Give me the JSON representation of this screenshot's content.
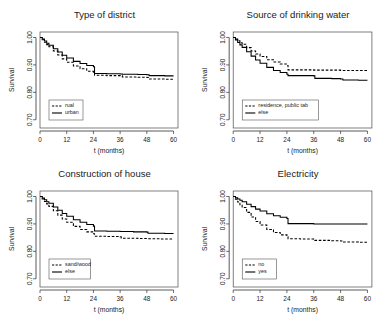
{
  "figure": {
    "background": "#ffffff",
    "line_color": "#000000",
    "axis_color": "#303030",
    "panel_layout": "2x2"
  },
  "chart_data": [
    {
      "type": "line",
      "title": "Type of district",
      "xlabel": "t (months)",
      "ylabel": "Survival",
      "xlim": [
        0,
        62
      ],
      "ylim": [
        0.67,
        1.02
      ],
      "xticks": [
        0,
        12,
        24,
        36,
        48,
        60
      ],
      "yticks": [
        0.7,
        0.8,
        0.9,
        1.0
      ],
      "ytick_labels": [
        "0.70",
        "0.80",
        "0.90",
        "1.00"
      ],
      "grid": false,
      "legend_position": "lower-left",
      "series": [
        {
          "name": "rual",
          "style": "dashed",
          "x": [
            0,
            1,
            2,
            3,
            4,
            6,
            8,
            10,
            12,
            15,
            18,
            21,
            24,
            24.5,
            30,
            36,
            37,
            44,
            48,
            49,
            56,
            60
          ],
          "y": [
            1.0,
            0.992,
            0.983,
            0.974,
            0.966,
            0.951,
            0.936,
            0.922,
            0.91,
            0.896,
            0.886,
            0.877,
            0.871,
            0.862,
            0.861,
            0.86,
            0.856,
            0.855,
            0.854,
            0.849,
            0.848,
            0.848
          ]
        },
        {
          "name": "urban",
          "style": "solid",
          "x": [
            0,
            1,
            2,
            3,
            4,
            6,
            8,
            10,
            12,
            15,
            18,
            21,
            24,
            24.5,
            30,
            36,
            37,
            44,
            48,
            49,
            56,
            60
          ],
          "y": [
            1.0,
            0.994,
            0.987,
            0.979,
            0.972,
            0.959,
            0.947,
            0.935,
            0.925,
            0.913,
            0.905,
            0.898,
            0.893,
            0.869,
            0.868,
            0.867,
            0.866,
            0.865,
            0.864,
            0.861,
            0.86,
            0.86
          ]
        }
      ]
    },
    {
      "type": "line",
      "title": "Source of drinking water",
      "xlabel": "t (months)",
      "ylabel": "Survival",
      "xlim": [
        0,
        62
      ],
      "ylim": [
        0.67,
        1.02
      ],
      "xticks": [
        0,
        12,
        24,
        36,
        48,
        60
      ],
      "yticks": [
        0.7,
        0.8,
        0.9,
        1.0
      ],
      "ytick_labels": [
        "0.70",
        "0.80",
        "0.90",
        "1.00"
      ],
      "grid": false,
      "legend_position": "lower-left",
      "series": [
        {
          "name": "residence, public tab",
          "style": "dashed",
          "x": [
            0,
            1,
            2,
            3,
            4,
            6,
            8,
            10,
            12,
            15,
            18,
            21,
            24,
            24.5,
            30,
            36,
            42,
            48,
            54,
            60
          ],
          "y": [
            1.0,
            0.994,
            0.988,
            0.981,
            0.975,
            0.963,
            0.951,
            0.94,
            0.931,
            0.919,
            0.911,
            0.903,
            0.898,
            0.882,
            0.882,
            0.881,
            0.881,
            0.88,
            0.88,
            0.879
          ]
        },
        {
          "name": "else",
          "style": "solid",
          "x": [
            0,
            1,
            2,
            3,
            4,
            6,
            8,
            10,
            12,
            15,
            18,
            21,
            24,
            24.5,
            30,
            36,
            36.5,
            44,
            48,
            49,
            56,
            60
          ],
          "y": [
            1.0,
            0.991,
            0.982,
            0.973,
            0.964,
            0.948,
            0.932,
            0.918,
            0.906,
            0.891,
            0.88,
            0.872,
            0.866,
            0.861,
            0.861,
            0.86,
            0.851,
            0.85,
            0.849,
            0.845,
            0.844,
            0.844
          ]
        }
      ]
    },
    {
      "type": "line",
      "title": "Construction of house",
      "xlabel": "t (months)",
      "ylabel": "Survival",
      "xlim": [
        0,
        62
      ],
      "ylim": [
        0.67,
        1.02
      ],
      "xticks": [
        0,
        12,
        24,
        36,
        48,
        60
      ],
      "yticks": [
        0.7,
        0.8,
        0.9,
        1.0
      ],
      "ytick_labels": [
        "0.70",
        "0.80",
        "0.90",
        "1.00"
      ],
      "grid": false,
      "legend_position": "lower-left",
      "series": [
        {
          "name": "sand/wood",
          "style": "dashed",
          "x": [
            0,
            1,
            2,
            3,
            4,
            6,
            8,
            10,
            12,
            15,
            18,
            21,
            24,
            24.5,
            30,
            36,
            36.5,
            44,
            48,
            54,
            60
          ],
          "y": [
            1.0,
            0.991,
            0.982,
            0.973,
            0.964,
            0.948,
            0.932,
            0.918,
            0.906,
            0.891,
            0.88,
            0.871,
            0.864,
            0.855,
            0.854,
            0.853,
            0.848,
            0.847,
            0.846,
            0.845,
            0.845
          ]
        },
        {
          "name": "else",
          "style": "solid",
          "x": [
            0,
            1,
            2,
            3,
            4,
            6,
            8,
            10,
            12,
            15,
            18,
            21,
            24,
            24.5,
            30,
            36,
            42,
            48,
            48.5,
            56,
            60
          ],
          "y": [
            1.0,
            0.994,
            0.988,
            0.981,
            0.975,
            0.962,
            0.95,
            0.938,
            0.928,
            0.915,
            0.906,
            0.898,
            0.892,
            0.874,
            0.873,
            0.872,
            0.871,
            0.87,
            0.866,
            0.865,
            0.865
          ]
        }
      ]
    },
    {
      "type": "line",
      "title": "Electricity",
      "xlabel": "t (months)",
      "ylabel": "Survival",
      "xlim": [
        0,
        62
      ],
      "ylim": [
        0.67,
        1.02
      ],
      "xticks": [
        0,
        12,
        24,
        36,
        48,
        60
      ],
      "yticks": [
        0.7,
        0.8,
        0.9,
        1.0
      ],
      "ytick_labels": [
        "0.70",
        "0.80",
        "0.90",
        "1.00"
      ],
      "grid": false,
      "legend_position": "lower-left",
      "series": [
        {
          "name": "no",
          "style": "dashed",
          "x": [
            0,
            1,
            2,
            3,
            4,
            6,
            8,
            10,
            12,
            15,
            18,
            21,
            24,
            24.5,
            30,
            36,
            36.5,
            44,
            48,
            49,
            56,
            60
          ],
          "y": [
            1.0,
            0.99,
            0.98,
            0.97,
            0.96,
            0.942,
            0.925,
            0.909,
            0.896,
            0.88,
            0.869,
            0.86,
            0.853,
            0.846,
            0.845,
            0.844,
            0.84,
            0.839,
            0.838,
            0.834,
            0.833,
            0.833
          ]
        },
        {
          "name": "yes",
          "style": "solid",
          "x": [
            0,
            1,
            2,
            3,
            4,
            6,
            8,
            10,
            12,
            15,
            18,
            21,
            24,
            24.5,
            30,
            36,
            42,
            48,
            54,
            60
          ],
          "y": [
            1.0,
            0.995,
            0.991,
            0.986,
            0.981,
            0.972,
            0.963,
            0.954,
            0.947,
            0.937,
            0.93,
            0.924,
            0.92,
            0.901,
            0.901,
            0.9,
            0.9,
            0.9,
            0.9,
            0.9
          ]
        }
      ]
    }
  ]
}
